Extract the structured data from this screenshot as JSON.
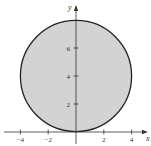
{
  "chart_data": {
    "type": "area",
    "title": "",
    "xlabel": "x",
    "ylabel": "y",
    "xlim": [
      -5,
      5.5
    ],
    "ylim": [
      -0.8,
      9
    ],
    "grid": false,
    "shape": {
      "kind": "circle",
      "center": [
        0,
        4
      ],
      "radius": 4,
      "filled": true
    },
    "x_ticks": [
      -4,
      -2,
      2,
      4
    ],
    "x_tick_labels": [
      "−4",
      "−2",
      "2",
      "4"
    ],
    "y_ticks": [
      2,
      4,
      6
    ],
    "y_tick_labels": [
      "2",
      "4",
      "6"
    ],
    "colors": {
      "fill": "#d3d3d3",
      "stroke": "#222222",
      "axis": "#333333"
    }
  }
}
